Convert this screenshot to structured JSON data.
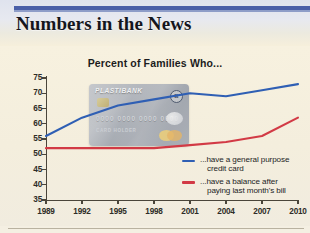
{
  "header": {
    "title": "Numbers in the News",
    "accent_color": "#4a5fa8"
  },
  "chart_data": {
    "type": "line",
    "title": "Percent of Families Who...",
    "xlabel": "",
    "ylabel": "",
    "x": [
      1989,
      1992,
      1995,
      1998,
      2001,
      2004,
      2007,
      2010
    ],
    "categories": [
      "1989",
      "1992",
      "1995",
      "1998",
      "2001",
      "2004",
      "2007",
      "2010"
    ],
    "xlim": [
      1989,
      2010
    ],
    "ylim": [
      35,
      75
    ],
    "yticks": [
      35,
      40,
      45,
      50,
      55,
      60,
      65,
      70,
      75
    ],
    "grid": false,
    "legend_position": "inside-bottom-right",
    "series": [
      {
        "name": "...have a general purpose credit card",
        "color": "#2f5fb4",
        "values": [
          56,
          62,
          66,
          68,
          70,
          69,
          71,
          73
        ]
      },
      {
        "name": "...have a balance after paying last month's bill",
        "color": "#d23a45",
        "values": [
          52,
          52,
          52,
          52,
          53,
          54,
          56,
          62
        ]
      }
    ]
  },
  "legend": {
    "items": [
      {
        "line1": "...have a general purpose",
        "line2": "credit card",
        "color": "#2f5fb4"
      },
      {
        "line1": "...have a balance after",
        "line2": "paying last month's bill",
        "color": "#d23a45"
      }
    ]
  },
  "card_graphic": {
    "brand": "PLASTIBANK",
    "number": "0000 0000 0000 0000",
    "holder": "CARD HOLDER",
    "mark": "B"
  }
}
